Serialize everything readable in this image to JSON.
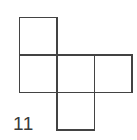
{
  "figure": {
    "label": "11",
    "kind": "cube-net",
    "colors": {
      "background": "#ffffff",
      "stroke": "#434343",
      "fill": "#ffffff",
      "label_text": "#3a3a3a"
    },
    "canvas": {
      "width": 137,
      "height": 140
    },
    "square_size": 37.5,
    "stroke_width": 1.6,
    "squares": [
      {
        "name": "top-square",
        "x": 19.5,
        "y": 17.5,
        "w": 37.5,
        "h": 37.5
      },
      {
        "name": "middle-left-square",
        "x": 19.5,
        "y": 55.0,
        "w": 37.5,
        "h": 37.5
      },
      {
        "name": "middle-center-square",
        "x": 57.0,
        "y": 55.0,
        "w": 37.5,
        "h": 37.5
      },
      {
        "name": "middle-right-square",
        "x": 94.5,
        "y": 55.0,
        "w": 37.5,
        "h": 37.5
      },
      {
        "name": "bottom-square",
        "x": 57.0,
        "y": 92.5,
        "w": 37.5,
        "h": 37.5
      }
    ]
  }
}
